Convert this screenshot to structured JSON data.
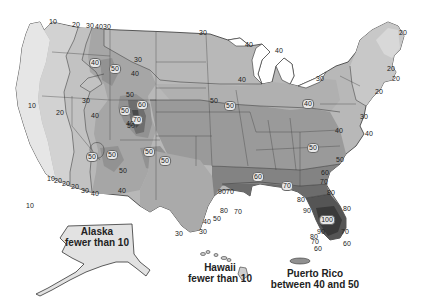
{
  "map": {
    "subject": "Contour map of the United States with numbered isolines",
    "shading_colors": {
      "10": "#e4e4e4",
      "20": "#d2d2d2",
      "30": "#bdbdbd",
      "40": "#a9a9a9",
      "50": "#959595",
      "60": "#808080",
      "70": "#6c6c6c",
      "80": "#565656",
      "90": "#3f3f3f",
      "100": "#2a2a2a"
    },
    "contour_labels": [
      {
        "text": "10",
        "x": 53,
        "y": 22
      },
      {
        "text": "20",
        "x": 76,
        "y": 25
      },
      {
        "text": "30",
        "x": 90,
        "y": 26
      },
      {
        "text": "40",
        "x": 99,
        "y": 27
      },
      {
        "text": "30",
        "x": 107,
        "y": 27
      },
      {
        "text": "30",
        "x": 203,
        "y": 33
      },
      {
        "text": "40",
        "x": 249,
        "y": 45
      },
      {
        "text": "40",
        "x": 279,
        "y": 51
      },
      {
        "text": "20",
        "x": 403,
        "y": 33
      },
      {
        "text": "20",
        "x": 391,
        "y": 69
      },
      {
        "text": "20",
        "x": 396,
        "y": 79
      },
      {
        "text": "20",
        "x": 379,
        "y": 92
      },
      {
        "text": "30",
        "x": 320,
        "y": 79
      },
      {
        "text": "30",
        "x": 364,
        "y": 117
      },
      {
        "text": "40",
        "x": 369,
        "y": 134
      },
      {
        "text": "40",
        "x": 339,
        "y": 131
      },
      {
        "text": "40",
        "x": 242,
        "y": 80
      },
      {
        "text": "40",
        "x": 308,
        "y": 104,
        "boxed": true
      },
      {
        "text": "50",
        "x": 230,
        "y": 106,
        "boxed": true
      },
      {
        "text": "50",
        "x": 214,
        "y": 101
      },
      {
        "text": "10",
        "x": 30,
        "y": 206
      },
      {
        "text": "10",
        "x": 32,
        "y": 106
      },
      {
        "text": "20",
        "x": 60,
        "y": 113
      },
      {
        "text": "30",
        "x": 86,
        "y": 101
      },
      {
        "text": "40",
        "x": 95,
        "y": 63,
        "boxed": true
      },
      {
        "text": "50",
        "x": 115,
        "y": 69,
        "boxed": true
      },
      {
        "text": "40",
        "x": 135,
        "y": 74
      },
      {
        "text": "30",
        "x": 138,
        "y": 60
      },
      {
        "text": "50",
        "x": 130,
        "y": 95
      },
      {
        "text": "50",
        "x": 125,
        "y": 111,
        "boxed": true
      },
      {
        "text": "60",
        "x": 142,
        "y": 105,
        "boxed": true
      },
      {
        "text": "70",
        "x": 137,
        "y": 120,
        "boxed": true
      },
      {
        "text": "50",
        "x": 131,
        "y": 126
      },
      {
        "text": "40",
        "x": 95,
        "y": 116
      },
      {
        "text": "40",
        "x": 130,
        "y": 124
      },
      {
        "text": "50",
        "x": 92,
        "y": 157,
        "boxed": true
      },
      {
        "text": "50",
        "x": 112,
        "y": 155,
        "boxed": true
      },
      {
        "text": "50",
        "x": 123,
        "y": 171
      },
      {
        "text": "50",
        "x": 149,
        "y": 152,
        "boxed": true
      },
      {
        "text": "50",
        "x": 165,
        "y": 161,
        "boxed": true
      },
      {
        "text": "10",
        "x": 51,
        "y": 179
      },
      {
        "text": "20",
        "x": 58,
        "y": 181
      },
      {
        "text": "20",
        "x": 66,
        "y": 184
      },
      {
        "text": "20",
        "x": 75,
        "y": 187
      },
      {
        "text": "30",
        "x": 85,
        "y": 191
      },
      {
        "text": "40",
        "x": 95,
        "y": 194
      },
      {
        "text": "40",
        "x": 122,
        "y": 191
      },
      {
        "text": "60",
        "x": 258,
        "y": 177,
        "boxed": true
      },
      {
        "text": "50",
        "x": 313,
        "y": 148,
        "boxed": true
      },
      {
        "text": "50",
        "x": 340,
        "y": 160
      },
      {
        "text": "60",
        "x": 325,
        "y": 173
      },
      {
        "text": "70",
        "x": 324,
        "y": 182
      },
      {
        "text": "70",
        "x": 287,
        "y": 186,
        "boxed": true
      },
      {
        "text": "80",
        "x": 331,
        "y": 193
      },
      {
        "text": "80",
        "x": 301,
        "y": 200
      },
      {
        "text": "90",
        "x": 307,
        "y": 211
      },
      {
        "text": "80",
        "x": 347,
        "y": 209
      },
      {
        "text": "100",
        "x": 327,
        "y": 220,
        "boxed": true
      },
      {
        "text": "70",
        "x": 230,
        "y": 192
      },
      {
        "text": "90",
        "x": 222,
        "y": 192
      },
      {
        "text": "50",
        "x": 217,
        "y": 219
      },
      {
        "text": "80",
        "x": 224,
        "y": 211
      },
      {
        "text": "70",
        "x": 238,
        "y": 212
      },
      {
        "text": "40",
        "x": 207,
        "y": 222
      },
      {
        "text": "30",
        "x": 203,
        "y": 232
      },
      {
        "text": "30",
        "x": 179,
        "y": 234
      },
      {
        "text": "90",
        "x": 321,
        "y": 232
      },
      {
        "text": "80",
        "x": 314,
        "y": 237
      },
      {
        "text": "70",
        "x": 315,
        "y": 242
      },
      {
        "text": "60",
        "x": 318,
        "y": 249
      },
      {
        "text": "70",
        "x": 345,
        "y": 232
      },
      {
        "text": "60",
        "x": 347,
        "y": 244
      }
    ],
    "insets": [
      {
        "name": "Alaska",
        "caption_line1": "Alaska",
        "caption_line2": "fewer than 10"
      },
      {
        "name": "Hawaii",
        "caption_line1": "Hawaii",
        "caption_line2": "fewer than 10"
      },
      {
        "name": "Puerto Rico",
        "caption_line1": "Puerto Rico",
        "caption_line2": "between 40 and 50"
      }
    ]
  }
}
